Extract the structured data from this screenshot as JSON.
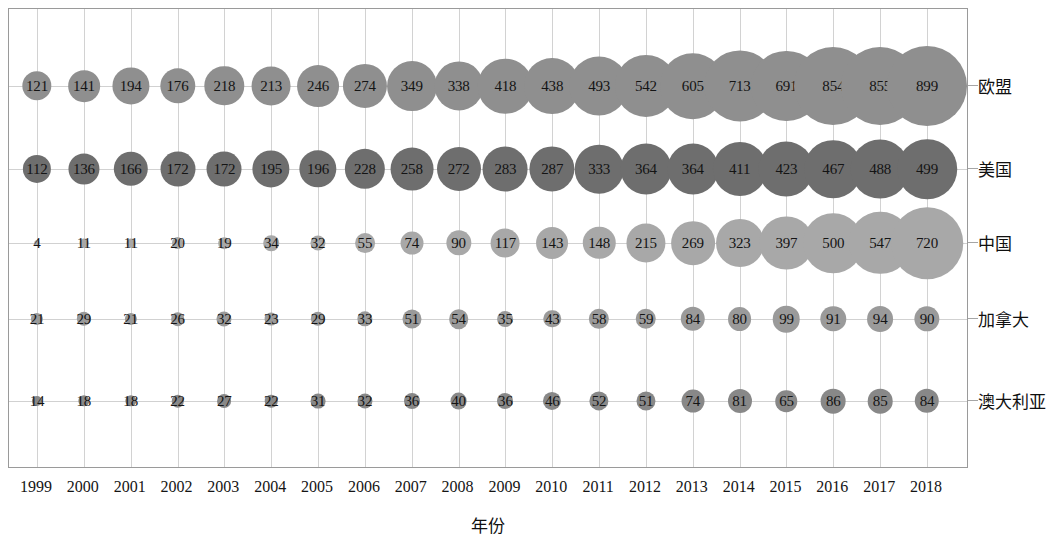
{
  "chart_data": {
    "type": "scatter",
    "subtype": "bubble",
    "title": "",
    "xlabel": "年份",
    "ylabel": "",
    "grid": true,
    "legend_position": "right-axis-labels",
    "categories": [
      "1999",
      "2000",
      "2001",
      "2002",
      "2003",
      "2004",
      "2005",
      "2006",
      "2007",
      "2008",
      "2009",
      "2010",
      "2011",
      "2012",
      "2013",
      "2014",
      "2015",
      "2016",
      "2017",
      "2018"
    ],
    "x": [
      1999,
      2000,
      2001,
      2002,
      2003,
      2004,
      2005,
      2006,
      2007,
      2008,
      2009,
      2010,
      2011,
      2012,
      2013,
      2014,
      2015,
      2016,
      2017,
      2018
    ],
    "series": [
      {
        "name": "欧盟",
        "color": "#8f8f8f",
        "values": [
          121,
          141,
          194,
          176,
          218,
          213,
          246,
          274,
          349,
          338,
          418,
          438,
          493,
          542,
          605,
          713,
          691,
          854,
          855,
          899
        ]
      },
      {
        "name": "美国",
        "color": "#6e6e6e",
        "values": [
          112,
          136,
          166,
          172,
          172,
          195,
          196,
          228,
          258,
          272,
          283,
          287,
          333,
          364,
          364,
          411,
          423,
          467,
          488,
          499
        ]
      },
      {
        "name": "中国",
        "color": "#a8a8a8",
        "values": [
          4,
          11,
          11,
          20,
          19,
          34,
          32,
          55,
          74,
          90,
          117,
          143,
          148,
          215,
          269,
          323,
          397,
          500,
          547,
          720
        ]
      },
      {
        "name": "加拿大",
        "color": "#9a9a9a",
        "values": [
          21,
          29,
          21,
          26,
          32,
          23,
          29,
          33,
          51,
          54,
          35,
          43,
          58,
          59,
          84,
          80,
          99,
          91,
          94,
          90
        ]
      },
      {
        "name": "澳大利亚",
        "color": "#888888",
        "values": [
          14,
          18,
          18,
          22,
          27,
          22,
          31,
          32,
          36,
          40,
          36,
          46,
          52,
          51,
          74,
          81,
          65,
          86,
          85,
          84
        ]
      }
    ]
  },
  "axis": {
    "x_title": "年份",
    "tick_labels": [
      "1999",
      "2000",
      "2001",
      "2002",
      "2003",
      "2004",
      "2005",
      "2006",
      "2007",
      "2008",
      "2009",
      "2010",
      "2011",
      "2012",
      "2013",
      "2014",
      "2015",
      "2016",
      "2017",
      "2018"
    ]
  },
  "series_labels": [
    "欧盟",
    "美国",
    "中国",
    "加拿大",
    "澳大利亚"
  ],
  "colors": {
    "eu": "#8f8f8f",
    "us": "#6e6e6e",
    "china": "#a8a8a8",
    "canada": "#9a9a9a",
    "australia": "#888888",
    "gridline": "#d2d2d2",
    "frame": "#9a9a9a",
    "text": "#141414"
  }
}
